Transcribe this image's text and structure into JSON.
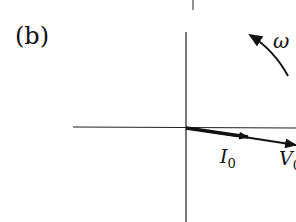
{
  "figure": {
    "panel_label": "(b)",
    "type": "phasor diagram",
    "colors": {
      "ink": "#111111",
      "background": "#ffffff"
    }
  },
  "rotation": {
    "symbol": "ω",
    "direction": "counterclockwise"
  },
  "phasors": [
    {
      "name": "I",
      "subscript": "0",
      "description": "current phasor, short thick arrow slightly below real axis"
    },
    {
      "name": "V",
      "subscript": "0",
      "description": "voltage phasor, longer thin arrow slightly below real axis"
    }
  ],
  "axes": {
    "horizontal": "real axis",
    "vertical": "imaginary axis"
  }
}
